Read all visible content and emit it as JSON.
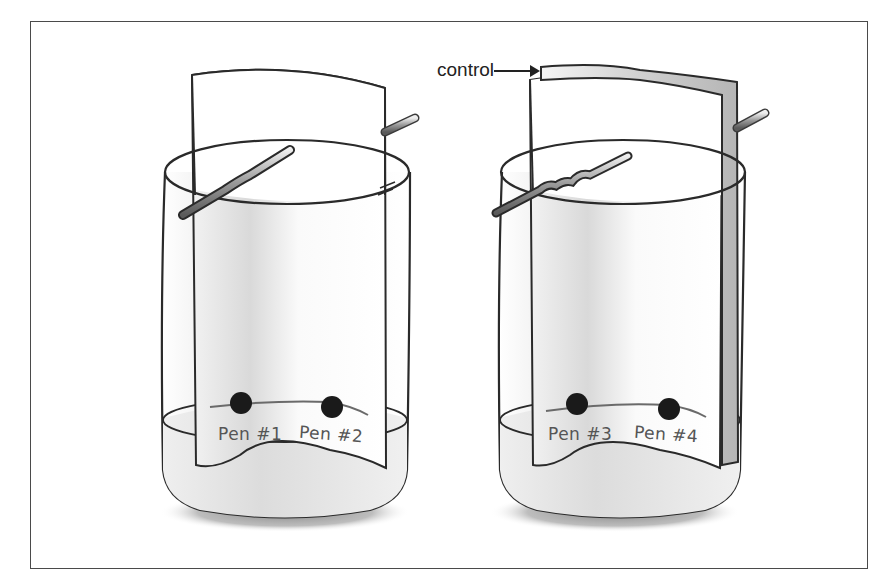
{
  "figure": {
    "callout_label": "control",
    "jars": [
      {
        "id": "left",
        "pens": [
          {
            "label": "Pen #1"
          },
          {
            "label": "Pen #2"
          }
        ]
      },
      {
        "id": "right",
        "has_control_strip": true,
        "pens": [
          {
            "label": "Pen #3"
          },
          {
            "label": "Pen #4"
          }
        ]
      }
    ],
    "colors": {
      "line": "#2a2a2a",
      "dot": "#1a1a1a",
      "liquid": "#e6e6e6",
      "frame": "#4a4a4a"
    }
  }
}
